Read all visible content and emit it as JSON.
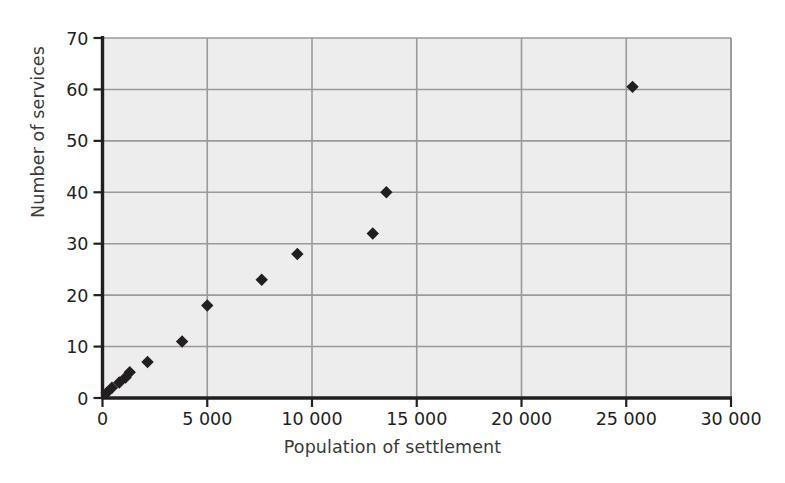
{
  "chart_data": {
    "type": "scatter",
    "title": "",
    "xlabel": "Population of settlement",
    "ylabel": "Number of services",
    "xlim": [
      0,
      30000
    ],
    "ylim": [
      0,
      70
    ],
    "xticks": [
      0,
      5000,
      10000,
      15000,
      20000,
      25000,
      30000
    ],
    "xtick_labels": [
      "0",
      "5 000",
      "10 000",
      "15 000",
      "20 000",
      "25 000",
      "30 000"
    ],
    "yticks": [
      0,
      10,
      20,
      30,
      40,
      50,
      60,
      70
    ],
    "ytick_labels": [
      "0",
      "10",
      "20",
      "30",
      "40",
      "50",
      "60",
      "70"
    ],
    "grid": true,
    "legend": null,
    "marker": "diamond",
    "marker_color": "#231f20",
    "plot_background": "#ededed",
    "gridline_color": "#9a9a9a",
    "axis_color": "#231f20",
    "series": [
      {
        "name": "Settlements",
        "points": [
          {
            "x": 200,
            "y": 1
          },
          {
            "x": 450,
            "y": 2
          },
          {
            "x": 800,
            "y": 3
          },
          {
            "x": 1100,
            "y": 4
          },
          {
            "x": 1300,
            "y": 5
          },
          {
            "x": 2150,
            "y": 7
          },
          {
            "x": 3800,
            "y": 11
          },
          {
            "x": 5000,
            "y": 18
          },
          {
            "x": 7600,
            "y": 23
          },
          {
            "x": 9300,
            "y": 28
          },
          {
            "x": 12900,
            "y": 32
          },
          {
            "x": 13550,
            "y": 40
          },
          {
            "x": 25300,
            "y": 60.5
          }
        ]
      }
    ]
  }
}
